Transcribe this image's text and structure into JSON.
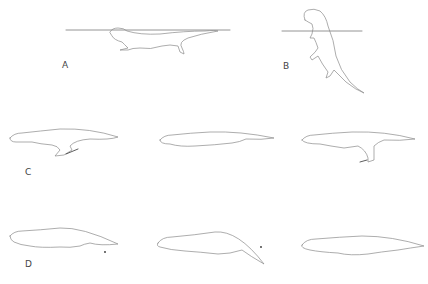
{
  "figure": {
    "panels": [
      {
        "id": "A",
        "label": "A",
        "label_pos": [
          62,
          66
        ],
        "description": "otter floating at surface, water line drawn"
      },
      {
        "id": "B",
        "label": "B",
        "label_pos": [
          283,
          67
        ],
        "description": "otter vertical, head above water line"
      },
      {
        "id": "C",
        "label": "C",
        "label_pos": [
          25,
          173
        ],
        "description": "three frames of hind-limb paddling with arrows",
        "frames": 3
      },
      {
        "id": "D",
        "label": "D",
        "label_pos": [
          25,
          265
        ],
        "description": "three frames of tail/body undulation with markers",
        "frames": 3
      }
    ],
    "colors": {
      "line": "#8a8a8a",
      "text": "#444444",
      "background": "#ffffff",
      "marker": "#333333"
    }
  }
}
